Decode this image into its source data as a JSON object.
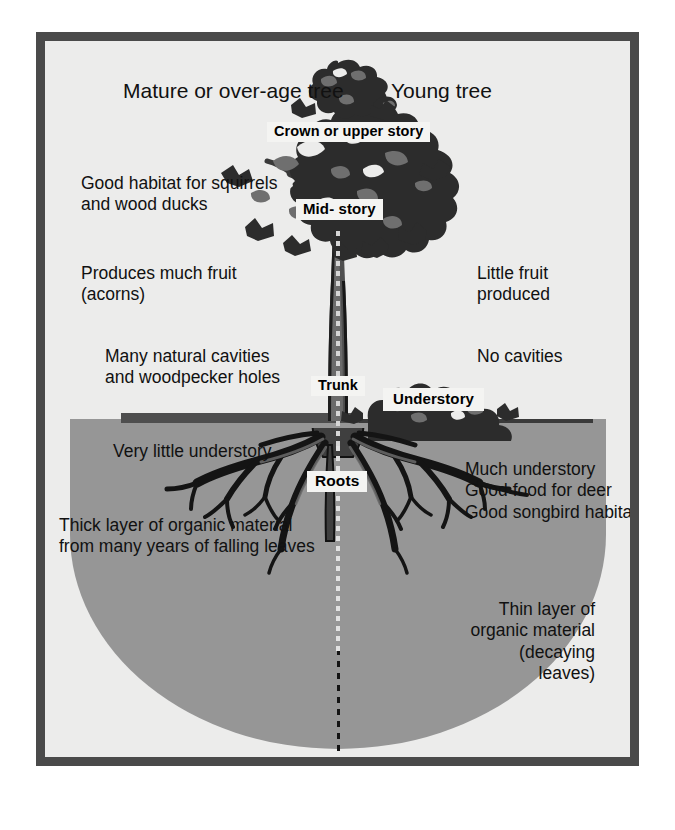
{
  "diagram": {
    "title_left": "Mature or over-age tree",
    "title_right": "Young tree",
    "structure_labels": {
      "crown": "Crown or upper story",
      "midstory": "Mid- story",
      "trunk": "Trunk",
      "understory": "Understory",
      "roots": "Roots"
    },
    "left_notes": [
      "Good habitat for squirrels\nand wood ducks",
      "Produces much fruit\n(acorns)",
      "Many natural cavities\nand woodpecker holes",
      "Very little understory",
      "Thick layer of organic material\nfrom many years of falling leaves"
    ],
    "right_notes": [
      "Little fruit\nproduced",
      "No cavities",
      "Much understory\nGood food for deer\nGood songbird habitat",
      "Thin layer of\norganic material\n(decaying\nleaves)"
    ],
    "colors": {
      "frame": "#4a4a4a",
      "background": "#ececeb",
      "soil": "#969696",
      "organic_layer": "#4e4e4e",
      "foliage_dark": "#2c2c2c",
      "foliage_mid": "#6f6f6f",
      "label_box": "#f4f4f2"
    }
  }
}
